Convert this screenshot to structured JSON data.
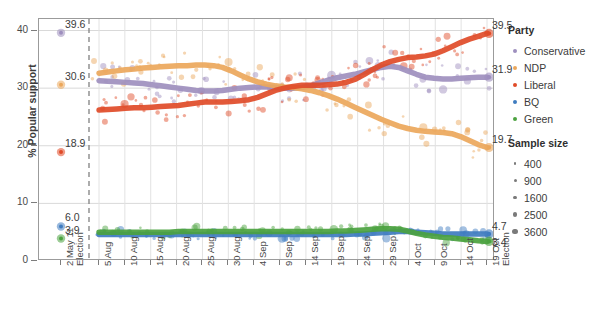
{
  "chart_data": {
    "type": "line",
    "title": "",
    "xlabel": "",
    "ylabel": "% Popular support",
    "ylim": [
      0,
      42
    ],
    "yticks": [
      0,
      10,
      20,
      30,
      40
    ],
    "grid": true,
    "legend_position": "right",
    "x_tick_labels": [
      {
        "line1": "2 May 11",
        "line2": "Election"
      },
      {
        "line1": "5 Aug",
        "line2": ""
      },
      {
        "line1": "10 Aug",
        "line2": ""
      },
      {
        "line1": "15 Aug",
        "line2": ""
      },
      {
        "line1": "20 Aug",
        "line2": ""
      },
      {
        "line1": "25 Aug",
        "line2": ""
      },
      {
        "line1": "30 Aug",
        "line2": ""
      },
      {
        "line1": "4 Sep",
        "line2": ""
      },
      {
        "line1": "9 Sep",
        "line2": ""
      },
      {
        "line1": "14 Sep",
        "line2": ""
      },
      {
        "line1": "19 Sep",
        "line2": ""
      },
      {
        "line1": "24 Sep",
        "line2": ""
      },
      {
        "line1": "29 Sep",
        "line2": ""
      },
      {
        "line1": "4 Oct",
        "line2": ""
      },
      {
        "line1": "9 Oct",
        "line2": ""
      },
      {
        "line1": "14 Oct",
        "line2": ""
      },
      {
        "line1": "19 Oct",
        "line2": "Election"
      }
    ],
    "election_marker_note": "dashed vertical line after 2 May 11 Election",
    "series": [
      {
        "name": "Conservative",
        "color": "#9e8fbe",
        "start_value": 39.6,
        "end_value": 31.9,
        "values": [
          31.3,
          31.2,
          31.1,
          31.0,
          30.9,
          30.8,
          30.6,
          30.4,
          30.2,
          30.0,
          29.8,
          29.6,
          29.5,
          29.5,
          29.6,
          29.8,
          30.0,
          30.1,
          30.2,
          30.2,
          30.1,
          30.0,
          30.0,
          30.1,
          30.4,
          30.9,
          31.4,
          31.8,
          32.1,
          32.4,
          32.8,
          33.2,
          33.6,
          33.8,
          33.6,
          33.0,
          32.4,
          31.9,
          31.7,
          31.6,
          31.6,
          31.7,
          31.8,
          31.9,
          31.9
        ]
      },
      {
        "name": "NDP",
        "color": "#eba75b",
        "start_value": 30.6,
        "end_value": 19.7,
        "values": [
          32.6,
          32.8,
          33.0,
          33.2,
          33.3,
          33.5,
          33.6,
          33.7,
          33.8,
          33.9,
          33.9,
          34.0,
          34.0,
          33.9,
          33.6,
          33.0,
          32.3,
          31.6,
          31.1,
          30.7,
          30.4,
          30.2,
          30.1,
          29.9,
          29.6,
          29.2,
          28.7,
          28.1,
          27.4,
          26.7,
          26.0,
          25.3,
          24.6,
          24.0,
          23.4,
          23.0,
          22.7,
          22.5,
          22.4,
          22.3,
          22.1,
          21.6,
          20.9,
          20.2,
          19.7
        ]
      },
      {
        "name": "Liberal",
        "color": "#e04b28",
        "start_value": 18.9,
        "end_value": 39.5,
        "values": [
          26.2,
          26.3,
          26.4,
          26.5,
          26.6,
          26.6,
          26.7,
          26.8,
          26.9,
          27.0,
          27.2,
          27.4,
          27.6,
          27.6,
          27.6,
          27.7,
          27.8,
          28.0,
          28.4,
          29.0,
          29.6,
          30.0,
          30.3,
          30.5,
          30.5,
          30.5,
          30.6,
          30.7,
          31.0,
          31.5,
          32.3,
          33.2,
          34.0,
          34.6,
          35.0,
          35.3,
          35.4,
          35.6,
          35.9,
          36.5,
          37.2,
          37.9,
          38.5,
          39.0,
          39.5
        ]
      },
      {
        "name": "BQ",
        "color": "#3f7cc0",
        "start_value": 6.0,
        "end_value": 4.7,
        "values": [
          4.6,
          4.6,
          4.6,
          4.6,
          4.6,
          4.6,
          4.6,
          4.6,
          4.6,
          4.6,
          4.6,
          4.6,
          4.6,
          4.6,
          4.6,
          4.6,
          4.6,
          4.6,
          4.6,
          4.6,
          4.6,
          4.6,
          4.6,
          4.6,
          4.6,
          4.6,
          4.6,
          4.6,
          4.6,
          4.7,
          4.7,
          4.8,
          4.9,
          5.0,
          5.1,
          5.1,
          5.0,
          4.9,
          4.8,
          4.7,
          4.7,
          4.7,
          4.7,
          4.7,
          4.7
        ]
      },
      {
        "name": "Green",
        "color": "#4ba23f",
        "start_value": 3.9,
        "end_value": 3.4,
        "values": [
          5.0,
          5.0,
          5.0,
          5.0,
          5.0,
          5.0,
          5.0,
          5.0,
          5.0,
          5.1,
          5.1,
          5.1,
          5.1,
          5.1,
          5.1,
          5.1,
          5.1,
          5.1,
          5.1,
          5.1,
          5.1,
          5.1,
          5.1,
          5.1,
          5.1,
          5.1,
          5.1,
          5.2,
          5.2,
          5.3,
          5.4,
          5.5,
          5.6,
          5.6,
          5.5,
          5.2,
          4.8,
          4.5,
          4.3,
          4.1,
          4.0,
          3.8,
          3.7,
          3.5,
          3.4
        ]
      }
    ],
    "endpoint_labels_left": [
      {
        "value": "39.6",
        "series": "Conservative"
      },
      {
        "value": "30.6",
        "series": "NDP"
      },
      {
        "value": "18.9",
        "series": "Liberal"
      },
      {
        "value": "6.0",
        "series": "BQ"
      },
      {
        "value": "3.9",
        "series": "Green"
      }
    ],
    "endpoint_labels_right": [
      {
        "value": "39.5",
        "series": "Liberal"
      },
      {
        "value": "31.9",
        "series": "Conservative"
      },
      {
        "value": "19.7",
        "series": "NDP"
      },
      {
        "value": "4.7",
        "series": "BQ"
      },
      {
        "value": "3.4",
        "series": "Green"
      }
    ]
  },
  "legend": {
    "party_title": "Party",
    "parties": [
      {
        "label": "Conservative",
        "color": "#9e8fbe"
      },
      {
        "label": "NDP",
        "color": "#eba75b"
      },
      {
        "label": "Liberal",
        "color": "#e04b28"
      },
      {
        "label": "BQ",
        "color": "#3f7cc0"
      },
      {
        "label": "Green",
        "color": "#4ba23f"
      }
    ],
    "sample_title": "Sample size",
    "sizes": [
      {
        "label": "400",
        "px": 2.2
      },
      {
        "label": "900",
        "px": 3.0
      },
      {
        "label": "1600",
        "px": 3.8
      },
      {
        "label": "2500",
        "px": 4.6
      },
      {
        "label": "3600",
        "px": 5.4
      }
    ]
  }
}
